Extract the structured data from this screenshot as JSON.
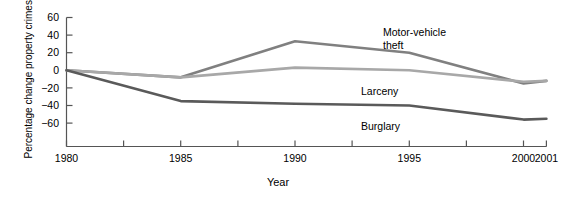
{
  "chart_data": {
    "type": "line",
    "title": "",
    "xlabel": "Year",
    "ylabel": "Percentage change property crimes since 1980",
    "x": [
      1980,
      1985,
      1990,
      1995,
      2000,
      2001
    ],
    "xlim": [
      1980,
      2001
    ],
    "ylim": [
      -70,
      60
    ],
    "grid": false,
    "legend_position": "inline-annotations",
    "xticks": [
      1980,
      1985,
      1990,
      1995,
      2000,
      2001
    ],
    "xtick_labels": [
      "1980",
      "1985",
      "1990",
      "1995",
      "2000",
      "2001"
    ],
    "x_minor_ticks": [
      1980,
      1982.5,
      1985,
      1987.5,
      1990,
      1992.5,
      1995,
      1997.5,
      2000,
      2001
    ],
    "yticks": [
      60,
      40,
      20,
      0,
      -20,
      -40,
      -60
    ],
    "ytick_labels": [
      "60",
      "40",
      "20",
      "0",
      "−20",
      "−40",
      "−60"
    ],
    "series": [
      {
        "name": "Motor-vehicle theft",
        "color": "#808080",
        "values": [
          0,
          -8,
          33,
          20,
          -15,
          -12
        ],
        "label_text_line1": "Motor-vehicle",
        "label_text_line2": "theft"
      },
      {
        "name": "Larceny",
        "color": "#a8a8a8",
        "values": [
          0,
          -8,
          3,
          0,
          -13,
          -12
        ],
        "label_text_line1": "Larceny",
        "label_text_line2": ""
      },
      {
        "name": "Burglary",
        "color": "#5a5a5a",
        "values": [
          0,
          -35,
          -38,
          -40,
          -56,
          -55
        ],
        "label_text_line1": "Burglary",
        "label_text_line2": ""
      }
    ],
    "annotations": [
      {
        "id": "motor-vehicle-theft-label",
        "line1": "Motor-vehicle",
        "line2": "theft"
      },
      {
        "id": "larceny-label",
        "line1": "Larceny",
        "line2": ""
      },
      {
        "id": "burglary-label",
        "line1": "Burglary",
        "line2": ""
      }
    ],
    "axis_color": "#555555"
  }
}
